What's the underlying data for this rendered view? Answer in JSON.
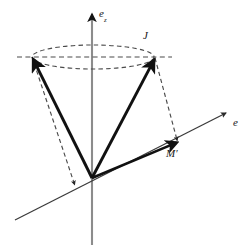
{
  "figure": {
    "width": 250,
    "height": 251,
    "background_color": "#ffffff"
  },
  "colors": {
    "vertical_axis": "#8c8c8c",
    "e_axis": "#3a3a3a",
    "vector_stroke": "#111111",
    "dashed_stroke": "#4a4a4a",
    "label_text": "#1a1a1a"
  },
  "labels": {
    "vertical_axis": {
      "base": "e",
      "subscript": "z"
    },
    "e_axis": {
      "base": "e"
    },
    "cone_apex_top": {
      "base": "J"
    },
    "projection_point": {
      "base": "M",
      "prime": "′"
    }
  },
  "axes": [
    {
      "name": "vertical-axis",
      "label": "e_z",
      "origin": [
        92,
        178
      ],
      "tip": [
        92,
        12
      ],
      "tail": [
        92,
        245
      ],
      "arrowhead": true,
      "style": "solid",
      "color": "#8c8c8c"
    },
    {
      "name": "e-axis",
      "label": "e",
      "origin": [
        92,
        178
      ],
      "tip": [
        228,
        112
      ],
      "tail": [
        15,
        220
      ],
      "arrowhead": true,
      "style": "solid",
      "color": "#3a3a3a"
    }
  ],
  "cone": {
    "apex": [
      92,
      178
    ],
    "ellipse": {
      "name": "precession-circle",
      "center": [
        93,
        57
      ],
      "rx": 61,
      "ry": 12,
      "style": "dashed"
    },
    "horizontal_dashed_chord": {
      "from": [
        17,
        57
      ],
      "to": [
        172,
        57
      ]
    }
  },
  "vectors": [
    {
      "name": "angular-momentum-vector-left",
      "from": [
        92,
        178
      ],
      "to": [
        32,
        57
      ],
      "style": "solid",
      "weight": "thick",
      "arrowhead": true
    },
    {
      "name": "angular-momentum-vector-right",
      "from": [
        92,
        178
      ],
      "to": [
        155,
        58
      ],
      "style": "solid",
      "weight": "thick",
      "arrowhead": true,
      "label": "J"
    },
    {
      "name": "projected-vector-M-prime",
      "from": [
        92,
        178
      ],
      "to": [
        178,
        142
      ],
      "style": "solid",
      "weight": "thick",
      "arrowhead": true,
      "label": "M′"
    }
  ],
  "projectors": [
    {
      "name": "projector-right",
      "from": [
        155,
        58
      ],
      "to": [
        178,
        142
      ],
      "style": "dashed",
      "arrowhead": true
    },
    {
      "name": "projector-left",
      "from": [
        32,
        57
      ],
      "to": [
        76,
        186
      ],
      "style": "dashed",
      "arrowhead": true
    }
  ]
}
